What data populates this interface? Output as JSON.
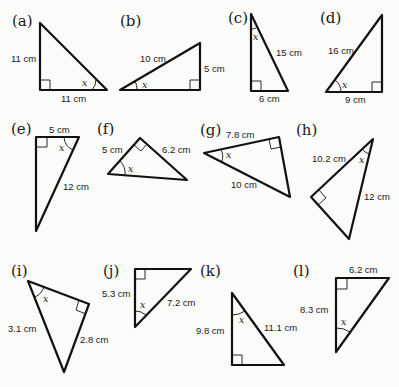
{
  "page": {
    "cropped_heading": "",
    "angle_symbol": "x"
  },
  "problems": [
    {
      "label": "(a)",
      "sides": [
        "11 cm",
        "11 cm"
      ]
    },
    {
      "label": "(b)",
      "sides": [
        "10 cm",
        "5 cm"
      ]
    },
    {
      "label": "(c)",
      "sides": [
        "15 cm",
        "6 cm"
      ]
    },
    {
      "label": "(d)",
      "sides": [
        "16 cm",
        "9 cm"
      ]
    },
    {
      "label": "(e)",
      "sides": [
        "5 cm",
        "12 cm"
      ]
    },
    {
      "label": "(f)",
      "sides": [
        "5 cm",
        "6.2 cm"
      ]
    },
    {
      "label": "(g)",
      "sides": [
        "7.8 cm",
        "10 cm"
      ]
    },
    {
      "label": "(h)",
      "sides": [
        "10.2 cm",
        "12 cm"
      ]
    },
    {
      "label": "(i)",
      "sides": [
        "3.1 cm",
        "2.8 cm"
      ]
    },
    {
      "label": "(j)",
      "sides": [
        "5.3 cm",
        "7.2 cm"
      ]
    },
    {
      "label": "(k)",
      "sides": [
        "9.8 cm",
        "11.1 cm"
      ]
    },
    {
      "label": "(l)",
      "sides": [
        "8.3 cm",
        "6.2 cm"
      ]
    }
  ]
}
